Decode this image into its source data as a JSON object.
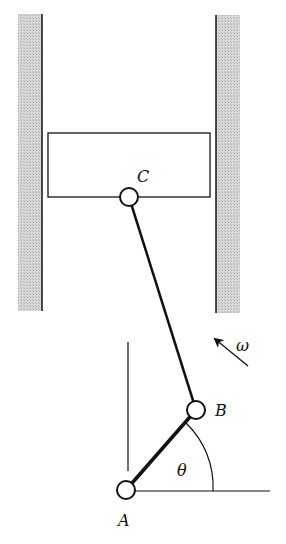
{
  "diagram": {
    "type": "slider-crank mechanism",
    "labels": {
      "piston_pin": "C",
      "crank_pin": "B",
      "ground_pivot": "A",
      "angle": "θ",
      "angular_velocity": "ω"
    },
    "colors": {
      "line": "#111111",
      "wall_hatch": "#c8c8c8",
      "background": "#ffffff"
    }
  }
}
